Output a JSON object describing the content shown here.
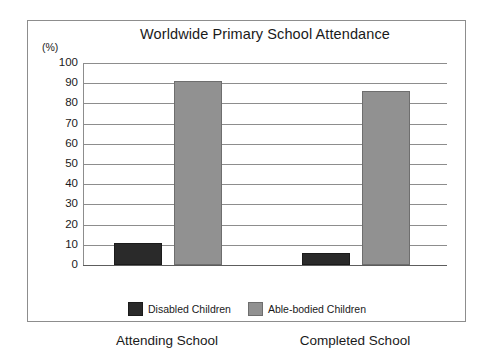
{
  "chart_data": {
    "type": "bar",
    "title": "Worldwide Primary School Attendance",
    "xlabel": "",
    "ylabel": "(%)",
    "categories": [
      "Attending School",
      "Completed School"
    ],
    "series": [
      {
        "name": "Disabled Children",
        "values": [
          10,
          5
        ],
        "color": "#2a2a2a"
      },
      {
        "name": "Able-bodied Children",
        "values": [
          90,
          85
        ],
        "color": "#919191"
      }
    ],
    "ylim": [
      0,
      100
    ],
    "ytick_labels": [
      "100",
      "90",
      "80",
      "70",
      "60",
      "50",
      "40",
      "30",
      "20",
      "10",
      "0"
    ],
    "ytick_values": [
      100,
      90,
      80,
      70,
      60,
      50,
      40,
      30,
      20,
      10,
      0
    ],
    "grid": true,
    "legend_position": "bottom"
  }
}
